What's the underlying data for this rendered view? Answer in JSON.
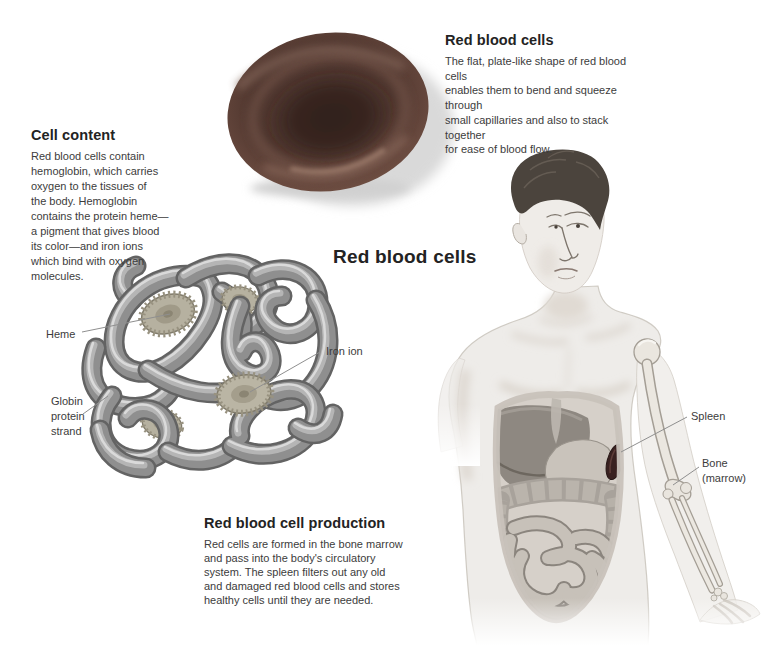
{
  "title": "Red blood cells",
  "callouts": {
    "rbc_shape": {
      "heading": "Red blood cells",
      "body_lines": [
        "The flat, plate-like shape of red blood cells",
        "enables them to bend and squeeze through",
        "small capillaries and also to stack together",
        "for ease of blood flow."
      ]
    },
    "cell_content": {
      "heading": "Cell content",
      "body_lines": [
        "Red blood cells contain",
        "hemoglobin, which carries",
        "oxygen to the tissues of",
        "the body. Hemoglobin",
        "contains the protein heme—",
        "a pigment that gives blood",
        "its color—and iron ions",
        "which bind with oxygen",
        "molecules."
      ]
    },
    "production": {
      "heading": "Red blood cell production",
      "body_lines": [
        "Red cells are formed in the bone marrow",
        "and pass into the body's circulatory",
        "system. The spleen filters out any old",
        "and damaged red blood cells and stores",
        "healthy cells until they are needed."
      ]
    }
  },
  "labels": {
    "heme": "Heme",
    "iron_ion": "Iron ion",
    "globin_lines": [
      "Globin",
      "protein",
      "strand"
    ],
    "spleen": "Spleen",
    "bone_lines": [
      "Bone",
      "(marrow)"
    ]
  },
  "colors": {
    "background": "#ffffff",
    "heading_text": "#232323",
    "body_text": "#3c3c3c",
    "red_blood_cell": "#50372f",
    "rbc_rim_highlight": "#6e4e42",
    "hemoglobin_tube": "#8f8f8f",
    "heme_disc": "#b6b1a0",
    "spleen_organ": "#392120",
    "figure_skin": "#eeece9",
    "leader_line": "#8f8f8f"
  }
}
